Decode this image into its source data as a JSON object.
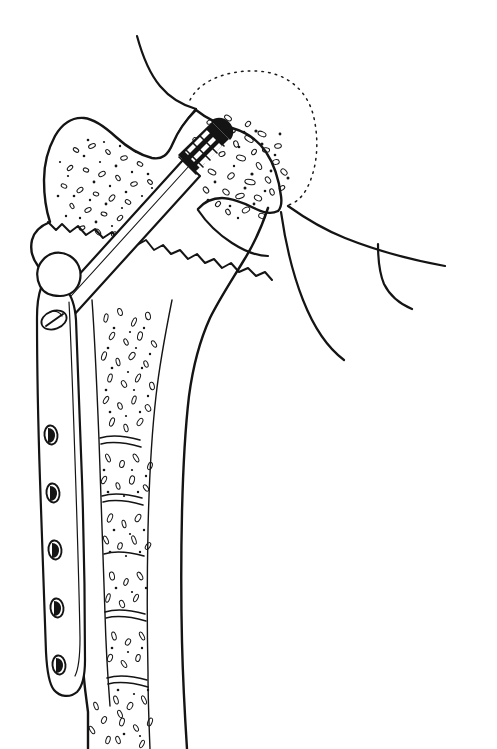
{
  "figure": {
    "title": "Dynamic hip screw fixation of an intertrochanteric femoral fracture",
    "view": "anteroposterior coronal cutaway",
    "medium": "black ink line drawing",
    "background_color": "#ffffff",
    "ink_color": "#141414",
    "width": 497,
    "height": 749
  },
  "anatomy": {
    "femoral_head": {
      "label": "femoral head",
      "bone_type": "cancellous",
      "texture": "dense trabecular stipple"
    },
    "greater_trochanter": {
      "label": "greater trochanter",
      "bone_type": "cancellous",
      "texture": "dense trabecular stipple"
    },
    "lesser_trochanter": {
      "label": "lesser trochanter"
    },
    "femoral_neck": {
      "label": "femoral neck"
    },
    "femoral_shaft": {
      "label": "femoral shaft",
      "bone_type": "cortical",
      "feature": "medullary canal with trabecular lining"
    },
    "joint_capsule": {
      "label": "joint capsule / acetabular outline",
      "line_style": "dotted arc"
    },
    "fracture": {
      "label": "intertrochanteric fracture line",
      "line_style": "jagged irregular"
    }
  },
  "implant": {
    "name": "dynamic hip screw",
    "components": [
      {
        "name": "lag screw",
        "label": "cancellous lag screw",
        "feature": "threaded tip seated in femoral head"
      },
      {
        "name": "barrel",
        "label": "barrel sleeve"
      },
      {
        "name": "side_plate",
        "label": "side plate",
        "hole_count": 6,
        "top_hole_type": "oval slot with screw head",
        "shaft_hole_type": "oval cortical screw hole"
      }
    ],
    "screw_holes": [
      {
        "index": 1,
        "kind": "slot-with-screw",
        "cy": 320
      },
      {
        "index": 2,
        "kind": "oval",
        "cy": 435
      },
      {
        "index": 3,
        "kind": "oval",
        "cy": 493
      },
      {
        "index": 4,
        "kind": "oval",
        "cy": 550
      },
      {
        "index": 5,
        "kind": "oval",
        "cy": 608
      },
      {
        "index": 6,
        "kind": "oval",
        "cy": 665
      }
    ]
  },
  "soft_tissue": {
    "lines": [
      {
        "name": "superior capsule line",
        "label": "superior soft tissue contour"
      },
      {
        "name": "inferior capsule line",
        "label": "inferior soft tissue contour"
      },
      {
        "name": "medial flare line",
        "label": "medial soft tissue contour"
      }
    ]
  }
}
